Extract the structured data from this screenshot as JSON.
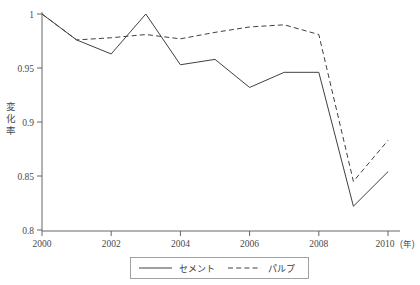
{
  "chart_data": {
    "type": "line",
    "title": "",
    "subtitle": "",
    "xlabel": "",
    "xlabel_unit": "(年)",
    "ylabel": "変化率",
    "ylabel_chars": [
      "変",
      "化",
      "率"
    ],
    "x": [
      2000,
      2001,
      2002,
      2003,
      2004,
      2005,
      2006,
      2007,
      2008,
      2009,
      2010
    ],
    "xlim": [
      2000,
      2010
    ],
    "ylim": [
      0.8,
      1.0
    ],
    "grid": false,
    "legend_position": "below-center",
    "x_tick_labels": [
      "2000",
      "2002",
      "2004",
      "2006",
      "2008",
      "2010"
    ],
    "x_tick_values": [
      2000,
      2002,
      2004,
      2006,
      2008,
      2010
    ],
    "y_tick_labels": [
      "0.8",
      "0.85",
      "0.9",
      "0.95",
      "1"
    ],
    "y_tick_values": [
      0.8,
      0.85,
      0.9,
      0.95,
      1.0
    ],
    "series": [
      {
        "name": "セメント",
        "style": "solid",
        "color": "#404040",
        "values": [
          1.0,
          0.976,
          0.963,
          1.0,
          0.953,
          0.958,
          0.932,
          0.946,
          0.946,
          0.822,
          0.854
        ]
      },
      {
        "name": "パルプ",
        "style": "dashed",
        "color": "#404040",
        "values": [
          1.0,
          0.976,
          0.978,
          0.981,
          0.977,
          0.983,
          0.988,
          0.99,
          0.981,
          0.845,
          0.883
        ]
      }
    ]
  },
  "legend": {
    "items": [
      {
        "label": "セメント",
        "style": "solid"
      },
      {
        "label": "パルプ",
        "style": "dashed"
      }
    ]
  },
  "axis": {
    "y_title": "変化率",
    "x_unit": "(年)"
  }
}
